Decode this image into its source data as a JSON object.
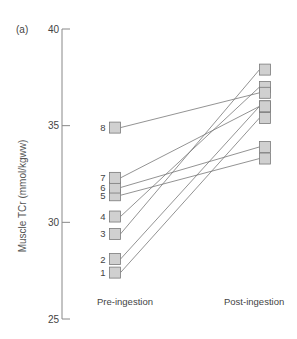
{
  "panel_label": "(a)",
  "chart_data": {
    "type": "line",
    "title": "",
    "panel": "(a)",
    "xlabel": "",
    "ylabel": "Muscle TCr (mmol/kgww)",
    "categories": [
      "Pre-ingestion",
      "Post-ingestion"
    ],
    "ylim": [
      25,
      40
    ],
    "yticks": [
      25,
      30,
      35,
      40
    ],
    "grid": false,
    "legend": null,
    "marker": "square",
    "series": [
      {
        "name": "1",
        "values": [
          27.4,
          35.4
        ]
      },
      {
        "name": "2",
        "values": [
          28.1,
          36.0
        ]
      },
      {
        "name": "3",
        "values": [
          29.4,
          37.9
        ]
      },
      {
        "name": "4",
        "values": [
          30.3,
          37.0
        ]
      },
      {
        "name": "5",
        "values": [
          31.4,
          33.3
        ]
      },
      {
        "name": "6",
        "values": [
          31.8,
          33.9
        ]
      },
      {
        "name": "7",
        "values": [
          32.3,
          36.0
        ]
      },
      {
        "name": "8",
        "values": [
          34.9,
          36.7
        ]
      }
    ]
  },
  "style": {
    "axis_color": "#888888",
    "line_color": "#777777",
    "marker_fill": "#d0d0d0",
    "marker_stroke": "#7a7a7a"
  }
}
